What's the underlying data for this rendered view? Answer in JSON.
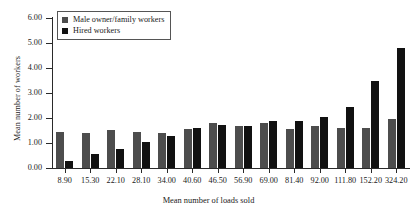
{
  "chart_data": {
    "type": "bar",
    "title": "",
    "xlabel": "Mean number of loads sold",
    "ylabel": "Mean number of workers",
    "ylim": [
      0,
      6
    ],
    "ytick_labels": [
      "0.00",
      "1.00",
      "2.00",
      "3.00",
      "4.00",
      "5.00",
      "6.00"
    ],
    "ytick_values": [
      0,
      1,
      2,
      3,
      4,
      5,
      6
    ],
    "grid": false,
    "legend_position": "top-left",
    "categories": [
      "8.90",
      "15.30",
      "22.10",
      "28.10",
      "34.00",
      "40.60",
      "46.50",
      "56.90",
      "69.00",
      "81.40",
      "92.00",
      "111.80",
      "152.20",
      "324.20"
    ],
    "series": [
      {
        "name": "Male owner/family workers",
        "color": "#4d4d4d",
        "values": [
          1.45,
          1.4,
          1.52,
          1.45,
          1.42,
          1.55,
          1.8,
          1.7,
          1.82,
          1.58,
          1.68,
          1.62,
          1.6,
          1.95
        ]
      },
      {
        "name": "Hired workers",
        "color": "#111111",
        "values": [
          0.28,
          0.55,
          0.78,
          1.05,
          1.3,
          1.62,
          1.72,
          1.7,
          1.88,
          1.88,
          2.05,
          2.45,
          3.5,
          4.8
        ]
      }
    ]
  },
  "legend": {
    "items": [
      {
        "label": "Male owner/family workers"
      },
      {
        "label": "Hired workers"
      }
    ]
  }
}
